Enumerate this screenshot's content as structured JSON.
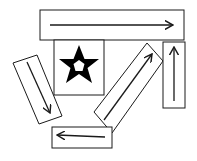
{
  "figure": {
    "background": "#ffffff",
    "stroke": "#1a1a1a",
    "star": {
      "shape": "five-pointed star with hollow pentagon center",
      "fill": "#000000"
    },
    "arrows": [
      {
        "id": "top",
        "direction": "right"
      },
      {
        "id": "left-tilted",
        "direction": "down-right"
      },
      {
        "id": "diagonal",
        "direction": "up-right"
      },
      {
        "id": "right-vertical",
        "direction": "up"
      },
      {
        "id": "bottom",
        "direction": "left"
      }
    ]
  }
}
